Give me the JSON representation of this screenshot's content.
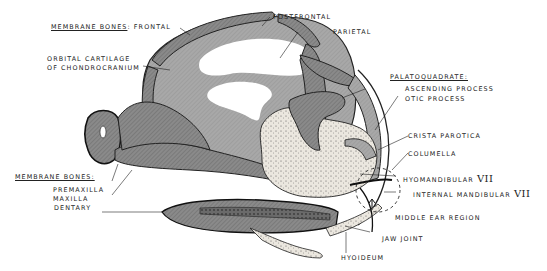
{
  "diagram": {
    "colors": {
      "bone_dark": "#7a7a7a",
      "bone_mid": "#9a9a9a",
      "cartilage_light": "#c4c4c4",
      "stipple": "#e8e4dc",
      "outline": "#1e1e1e",
      "background": "#ffffff"
    }
  },
  "labels": {
    "membrane_bones_top": "MEMBRANE BONES",
    "membrane_bones_top_sep": ":",
    "frontal": "FRONTAL",
    "orbital_line1": "ORBITAL CARTILAGE",
    "orbital_line2": "OF CHONDROCRANIUM",
    "postfrontal": "POSTFRONTAL",
    "parietal": "PARIETAL",
    "palatoquadrate": "PALATOQUADRATE:",
    "ascending_process": "ASCENDING PROCESS",
    "otic_process": "OTIC PROCESS",
    "crista_parotica": "CRISTA PAROTICA",
    "columella": "COLUMELLA",
    "hyomandibular": "HYOMANDIBULAR",
    "hyomandibular_num": "VII",
    "internal_mandibular": "INTERNAL MANDIBULAR",
    "internal_mandibular_num": "VII",
    "middle_ear_region": "MIDDLE EAR REGION",
    "jaw_joint": "JAW JOINT",
    "hyoideum": "HYOIDEUM",
    "membrane_bones_bottom": "MEMBRANE BONES:",
    "premaxilla": "PREMAXILLA",
    "maxilla": "MAXILLA",
    "dentary": "DENTARY"
  }
}
